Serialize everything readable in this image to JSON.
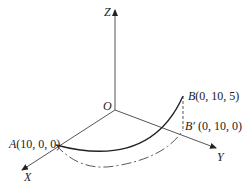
{
  "diagram": {
    "type": "3d-coordinate-curve",
    "axes": {
      "x_label": "X",
      "y_label": "Y",
      "z_label": "Z",
      "origin_label": "O"
    },
    "points": {
      "A": {
        "name": "A",
        "coords": "(10, 0, 0)"
      },
      "B": {
        "name": "B",
        "coords": "(0, 10, 5)"
      },
      "B_prime": {
        "name": "B′",
        "coords": " (0, 10, 0)"
      }
    },
    "curves": [
      {
        "name": "space-curve-A-B",
        "style": "solid"
      },
      {
        "name": "projection-arc-A-Bprime",
        "style": "dash-dot"
      },
      {
        "name": "vertical-B-Bprime",
        "style": "dashed"
      }
    ],
    "colors": {
      "line": "#222222",
      "background": "#ffffff"
    }
  }
}
